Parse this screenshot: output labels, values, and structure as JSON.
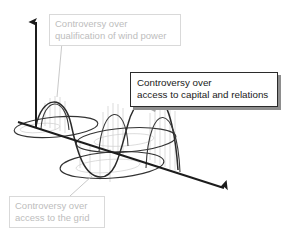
{
  "diagram": {
    "background_color": "#ffffff",
    "muted_color": "#bdbdbd",
    "active_color": "#1a1a1a",
    "axis_color": "#1c1c1c",
    "curve_color": "#2a2a2a",
    "hatch_color": "#c9c9c9",
    "shadow_color": "#8e8e8e",
    "callouts": {
      "wind_power": {
        "line1": "Controversy over",
        "line2": "qualification of wind power",
        "state": "muted"
      },
      "capital_relations": {
        "line1": "Controversy over",
        "line2": "access to capital and relations",
        "state": "highlighted"
      },
      "grid_access": {
        "line1": "Controversy over",
        "line2": "access to the grid",
        "state": "muted"
      }
    }
  }
}
